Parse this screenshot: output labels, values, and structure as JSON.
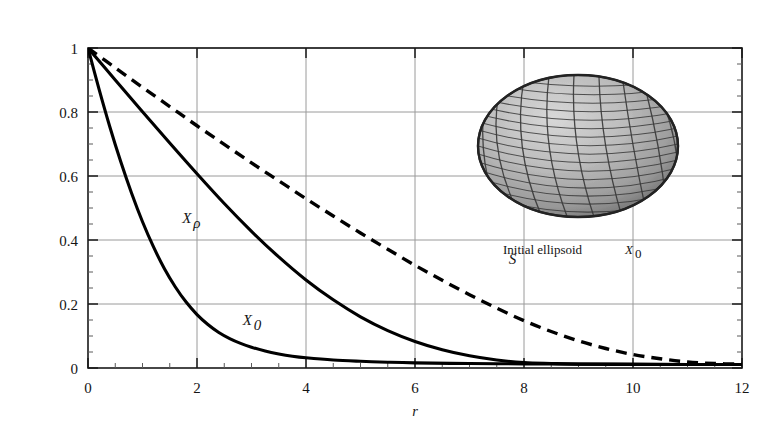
{
  "figure": {
    "title_parts": {
      "prefix": "Set covariances: Initial Ellipsoid ",
      "x0": "X",
      "x0_sub": "0",
      "mid": ", the set ",
      "xrho": "X",
      "xrho_sub": "ρ",
      "with": " with ",
      "rho_eq": "ρ=3",
      "suffix": " and a sphere"
    },
    "title_plain": "Set covariances: Initial Ellipsoid X0, the set Xρ with ρ=3 and a sphere",
    "background_color": "#ffffff",
    "frame_color": "#1a1a1a",
    "grid_color": "#9a9a9a"
  },
  "annotations": {
    "inset_caption": "Initial ellipsoid ",
    "inset_caption_sym": "X",
    "inset_caption_sub": "0",
    "inset_caption_plain": "Initial ellipsoid X0",
    "ellipsoid_inset_name": "wireframe-ellipsoid",
    "ellipsoid_fill": "#b5b5b5",
    "ellipsoid_mesh_color": "#2b2b2b"
  },
  "chart_data": {
    "type": "line",
    "title": "Set covariances: Initial Ellipsoid X0, the set Xρ with ρ=3 and a sphere",
    "xlabel": "r",
    "ylabel": "γ0(r), γρ(r), γs(r)",
    "ylabel_parts": [
      {
        "sym": "γ",
        "sub": "0",
        "arg": "(r)"
      },
      {
        "sym": "γ",
        "sub": "ρ",
        "arg": "(r)"
      },
      {
        "sym": "γ",
        "sub": "s",
        "arg": "(r)"
      }
    ],
    "xlim": [
      0,
      12
    ],
    "ylim": [
      0,
      1
    ],
    "xticks": [
      0,
      2,
      4,
      6,
      8,
      10,
      12
    ],
    "xticklabels": [
      "0",
      "2",
      "4",
      "6",
      "8",
      "10",
      "12"
    ],
    "yticks": [
      0,
      0.2,
      0.4,
      0.6,
      0.8,
      1
    ],
    "yticklabels": [
      "0",
      "0.2",
      "0.4",
      "0.6",
      "0.8",
      "1"
    ],
    "x_minor_step": 0.5,
    "y_minor_step": 0.05,
    "grid": true,
    "grid_axes": "both-major",
    "legend": "inline-labels",
    "series": [
      {
        "name": "X0",
        "label": "X",
        "label_sub": "0",
        "label_plain": "X0",
        "style": "solid",
        "color": "#000000",
        "width": 3.1,
        "label_x": 2.84,
        "label_y": 0.135,
        "x": [
          0,
          0.2,
          0.4,
          0.6,
          0.8,
          1.0,
          1.2,
          1.4,
          1.6,
          1.8,
          2.0,
          2.2,
          2.4,
          2.6,
          2.8,
          3.0,
          3.25,
          3.5,
          3.75,
          4.0,
          4.5,
          5.0,
          5.5,
          6.0,
          7.0,
          8.0,
          9.0,
          10.0,
          11.0,
          12.0
        ],
        "y": [
          1.0,
          0.873,
          0.754,
          0.645,
          0.546,
          0.457,
          0.379,
          0.311,
          0.254,
          0.206,
          0.167,
          0.136,
          0.111,
          0.092,
          0.077,
          0.065,
          0.053,
          0.044,
          0.037,
          0.032,
          0.025,
          0.021,
          0.018,
          0.016,
          0.014,
          0.013,
          0.012,
          0.012,
          0.011,
          0.011
        ]
      },
      {
        "name": "Xrho",
        "label": "X",
        "label_sub": "ρ",
        "label_plain": "Xρ",
        "style": "solid",
        "color": "#000000",
        "width": 3.1,
        "label_x": 1.73,
        "label_y": 0.452,
        "x": [
          0,
          0.5,
          1.0,
          1.5,
          2.0,
          2.5,
          3.0,
          3.5,
          4.0,
          4.5,
          5.0,
          5.5,
          6.0,
          6.5,
          7.0,
          7.5,
          8.0,
          8.5,
          9.0,
          10.0,
          11.0,
          12.0
        ],
        "y": [
          1.0,
          0.9,
          0.801,
          0.703,
          0.607,
          0.514,
          0.427,
          0.347,
          0.275,
          0.213,
          0.16,
          0.117,
          0.083,
          0.057,
          0.038,
          0.025,
          0.017,
          0.014,
          0.012,
          0.011,
          0.011,
          0.011
        ]
      },
      {
        "name": "S",
        "label": "S",
        "label_sub": "",
        "label_plain": "S",
        "style": "dashed",
        "color": "#000000",
        "width": 3.4,
        "dash": "11,7",
        "label_x": 7.72,
        "label_y": 0.326,
        "x": [
          0,
          0.5,
          1.0,
          1.5,
          2.0,
          2.5,
          3.0,
          3.5,
          4.0,
          4.5,
          5.0,
          5.5,
          6.0,
          6.5,
          7.0,
          7.5,
          8.0,
          8.5,
          9.0,
          9.5,
          10.0,
          10.5,
          11.0,
          11.5,
          12.0
        ],
        "y": [
          1.0,
          0.938,
          0.877,
          0.817,
          0.757,
          0.699,
          0.641,
          0.585,
          0.529,
          0.475,
          0.422,
          0.371,
          0.321,
          0.274,
          0.229,
          0.187,
          0.148,
          0.114,
          0.085,
          0.061,
          0.042,
          0.029,
          0.019,
          0.014,
          0.012
        ]
      }
    ]
  }
}
